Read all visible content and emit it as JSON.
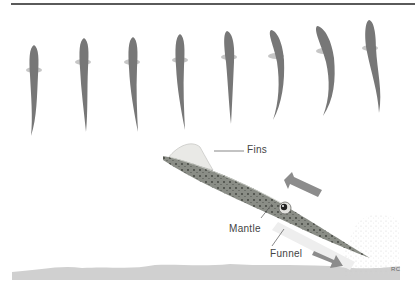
{
  "figure": {
    "type": "diagram",
    "sequence_panel": {
      "frame_count": 8,
      "description": "top-down silhouettes of squid swimming, progressively bending tail"
    },
    "labels": {
      "fins": "Fins",
      "mantle": "Mantle",
      "funnel": "Funnel",
      "signature": "RC"
    },
    "arrows": [
      {
        "name": "swim-direction-arrow",
        "direction": "up-left"
      },
      {
        "name": "jet-direction-arrow",
        "direction": "down-right"
      }
    ],
    "colors": {
      "silhouette": "#777777",
      "fin": "#bdbdbd",
      "squid_body": "#8a8d86",
      "arrow": "#8c8c8c",
      "seabed": "#cfcfcf",
      "rule": "#5a5a5a"
    }
  }
}
